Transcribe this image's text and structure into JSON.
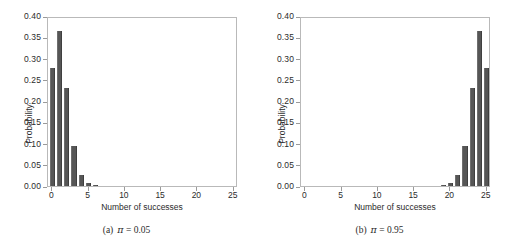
{
  "figure": {
    "background": "#ffffff",
    "bar_color": "#565656",
    "axis_color": "#b9b9b9"
  },
  "panels": [
    {
      "id": "a",
      "caption_label": "(a)",
      "caption_symbol": "π",
      "caption_value": "= 0.05",
      "caption_full": "(a)  π = 0.05"
    },
    {
      "id": "b",
      "caption_label": "(b)",
      "caption_symbol": "π",
      "caption_value": "= 0.95",
      "caption_full": "(b)  π = 0.95"
    }
  ],
  "axes": {
    "xlabel": "Number of successes",
    "ylabel": "Probability",
    "xticks": [
      "0",
      "5",
      "10",
      "15",
      "20",
      "25"
    ],
    "xtick_values": [
      0,
      5,
      10,
      15,
      20,
      25
    ],
    "yticks": [
      "0.00",
      "0.05",
      "0.10",
      "0.15",
      "0.20",
      "0.25",
      "0.30",
      "0.35",
      "0.40"
    ],
    "ytick_values": [
      0.0,
      0.05,
      0.1,
      0.15,
      0.2,
      0.25,
      0.3,
      0.35,
      0.4
    ],
    "xlim": [
      -0.6,
      25.6
    ],
    "ylim": [
      0,
      0.4
    ],
    "grid": false
  },
  "chart_data": [
    {
      "type": "bar",
      "title": "(a) π = 0.05",
      "xlabel": "Number of successes",
      "ylabel": "Probability",
      "xlim": [
        -0.6,
        25.6
      ],
      "ylim": [
        0,
        0.4
      ],
      "grid": false,
      "legend": null,
      "distribution": "Binomial(n = 25, π = 0.05)",
      "categories": [
        0,
        1,
        2,
        3,
        4,
        5,
        6,
        7,
        8,
        9,
        10,
        11,
        12,
        13,
        14,
        15,
        16,
        17,
        18,
        19,
        20,
        21,
        22,
        23,
        24,
        25
      ],
      "values": [
        0.277,
        0.365,
        0.231,
        0.093,
        0.027,
        0.006,
        0.001,
        0.0,
        0.0,
        0.0,
        0.0,
        0.0,
        0.0,
        0.0,
        0.0,
        0.0,
        0.0,
        0.0,
        0.0,
        0.0,
        0.0,
        0.0,
        0.0,
        0.0,
        0.0,
        0.0
      ]
    },
    {
      "type": "bar",
      "title": "(b) π = 0.95",
      "xlabel": "Number of successes",
      "ylabel": "Probability",
      "xlim": [
        -0.6,
        25.6
      ],
      "ylim": [
        0,
        0.4
      ],
      "grid": false,
      "legend": null,
      "distribution": "Binomial(n = 25, π = 0.95)",
      "categories": [
        0,
        1,
        2,
        3,
        4,
        5,
        6,
        7,
        8,
        9,
        10,
        11,
        12,
        13,
        14,
        15,
        16,
        17,
        18,
        19,
        20,
        21,
        22,
        23,
        24,
        25
      ],
      "values": [
        0.0,
        0.0,
        0.0,
        0.0,
        0.0,
        0.0,
        0.0,
        0.0,
        0.0,
        0.0,
        0.0,
        0.0,
        0.0,
        0.0,
        0.0,
        0.0,
        0.0,
        0.0,
        0.0,
        0.001,
        0.006,
        0.027,
        0.093,
        0.231,
        0.365,
        0.277
      ]
    }
  ]
}
